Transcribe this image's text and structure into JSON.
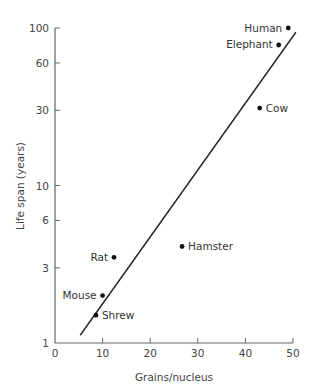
{
  "chart_data": {
    "type": "scatter",
    "title": "",
    "xlabel": "Grains/nucleus",
    "ylabel": "Life span (years)",
    "xlim": [
      0,
      50
    ],
    "ylim": [
      1,
      100
    ],
    "yscale": "log",
    "grid": false,
    "legend": null,
    "x_ticks": [
      0,
      10,
      20,
      30,
      40,
      50
    ],
    "y_ticks": [
      1,
      3,
      6,
      10,
      30,
      60,
      100
    ],
    "points": [
      {
        "label": "Human",
        "x": 49,
        "y": 100
      },
      {
        "label": "Elephant",
        "x": 47,
        "y": 78
      },
      {
        "label": "Cow",
        "x": 43,
        "y": 31
      },
      {
        "label": "Hamster",
        "x": 26.7,
        "y": 4.1
      },
      {
        "label": "Rat",
        "x": 12.4,
        "y": 3.5
      },
      {
        "label": "Mouse",
        "x": 10,
        "y": 2
      },
      {
        "label": "Shrew",
        "x": 8.6,
        "y": 1.5
      }
    ],
    "fit_line": {
      "x": [
        5.3,
        50.6
      ],
      "y": [
        1.12,
        94
      ]
    }
  }
}
